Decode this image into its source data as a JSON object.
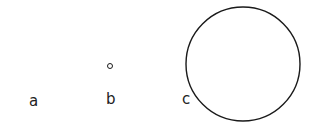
{
  "figure": {
    "panels": [
      {
        "label": "a",
        "shape": "point",
        "cx": 33,
        "cy": 66,
        "r": 0
      },
      {
        "label": "b",
        "shape": "circle",
        "cx": 110,
        "cy": 66,
        "r": 2.5
      },
      {
        "label": "c",
        "shape": "circle",
        "cx": 243,
        "cy": 64,
        "r": 57
      }
    ],
    "stroke_color": "#1a1a1a"
  }
}
